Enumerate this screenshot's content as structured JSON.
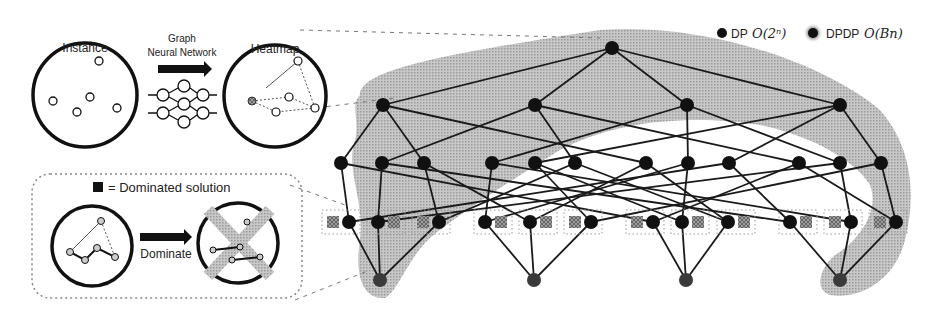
{
  "pipeline": {
    "instance_label": "Instance",
    "gnn_label_line1": "Graph",
    "gnn_label_line2": "Neural Network",
    "heatmap_label": "Heatmap"
  },
  "dominance_box": {
    "legend_text": "= Dominated solution",
    "dominate_label": "Dominate"
  },
  "legend": {
    "dp_label": "DP",
    "dp_complexity": "O(2ⁿ)",
    "dpdp_label": "DPDP",
    "dpdp_complexity": "O(Bn)"
  },
  "colors": {
    "node": "#111111",
    "bottom_node": "#3a3a3a",
    "shade": "#b8b8b8",
    "edge": "#1a1a1a",
    "dominated": "#555555"
  },
  "tree": {
    "root": {
      "x": 612,
      "y": 48
    },
    "level1": [
      {
        "x": 383,
        "y": 105
      },
      {
        "x": 535,
        "y": 105
      },
      {
        "x": 687,
        "y": 105
      },
      {
        "x": 840,
        "y": 105
      }
    ],
    "level2": [
      {
        "x": 341,
        "y": 163
      },
      {
        "x": 382,
        "y": 163
      },
      {
        "x": 424,
        "y": 163
      },
      {
        "x": 492,
        "y": 163
      },
      {
        "x": 535,
        "y": 163
      },
      {
        "x": 575,
        "y": 163
      },
      {
        "x": 646,
        "y": 163
      },
      {
        "x": 688,
        "y": 163
      },
      {
        "x": 729,
        "y": 163
      },
      {
        "x": 799,
        "y": 163
      },
      {
        "x": 840,
        "y": 163
      },
      {
        "x": 881,
        "y": 163
      }
    ],
    "level3_pairs": [
      {
        "node": 349,
        "dom": 333
      },
      {
        "node": 378,
        "dom": 394
      },
      {
        "node": 439,
        "dom": 423
      },
      {
        "node": 485,
        "dom": 501
      },
      {
        "node": 530,
        "dom": 546
      },
      {
        "node": 591,
        "dom": 575
      },
      {
        "node": 653,
        "dom": 637
      },
      {
        "node": 682,
        "dom": 698
      },
      {
        "node": 728,
        "dom": 744
      },
      {
        "node": 790,
        "dom": 806
      },
      {
        "node": 851,
        "dom": 835
      },
      {
        "node": 896,
        "dom": 880
      }
    ],
    "level3_y": 222,
    "bottom": [
      {
        "x": 380,
        "y": 280
      },
      {
        "x": 534,
        "y": 280
      },
      {
        "x": 686,
        "y": 280
      },
      {
        "x": 840,
        "y": 280
      }
    ],
    "edges_root_l1": [
      0,
      1,
      2,
      3
    ],
    "edges_l1_l2": [
      [
        0,
        0
      ],
      [
        0,
        2
      ],
      [
        0,
        6
      ],
      [
        1,
        1
      ],
      [
        1,
        5
      ],
      [
        1,
        9
      ],
      [
        2,
        3
      ],
      [
        2,
        7
      ],
      [
        2,
        10
      ],
      [
        3,
        4
      ],
      [
        3,
        8
      ],
      [
        3,
        11
      ]
    ],
    "edges_l2_l3": [
      [
        0,
        0
      ],
      [
        0,
        6
      ],
      [
        1,
        1
      ],
      [
        1,
        9
      ],
      [
        2,
        2
      ],
      [
        2,
        4
      ],
      [
        3,
        3
      ],
      [
        3,
        10
      ],
      [
        4,
        5
      ],
      [
        4,
        7
      ],
      [
        5,
        8
      ],
      [
        5,
        2
      ],
      [
        6,
        4
      ],
      [
        6,
        8
      ],
      [
        7,
        3
      ],
      [
        7,
        7
      ],
      [
        8,
        0
      ],
      [
        8,
        9
      ],
      [
        9,
        6
      ],
      [
        9,
        11
      ],
      [
        10,
        1
      ],
      [
        10,
        10
      ],
      [
        11,
        5
      ],
      [
        11,
        11
      ]
    ],
    "edges_l3_bottom": [
      [
        0,
        0
      ],
      [
        1,
        0
      ],
      [
        2,
        0
      ],
      [
        3,
        1
      ],
      [
        4,
        1
      ],
      [
        5,
        1
      ],
      [
        6,
        2
      ],
      [
        7,
        2
      ],
      [
        8,
        2
      ],
      [
        9,
        3
      ],
      [
        10,
        3
      ],
      [
        11,
        3
      ]
    ]
  }
}
